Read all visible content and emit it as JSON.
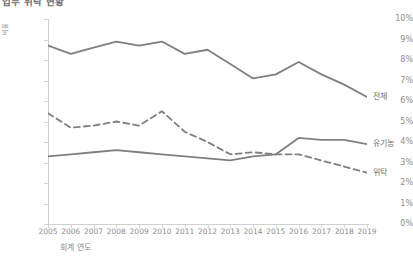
{
  "chart_title": "업무 위탁 현황",
  "axis": {
    "ylabel": "비율",
    "xlabel": "회계 연도",
    "ytick_labels": [
      "10%",
      "9%",
      "8%",
      "7%",
      "6%",
      "5%",
      "4%",
      "3%",
      "2%",
      "1%",
      "0%"
    ],
    "xtick_labels": [
      "2005",
      "2006",
      "2007",
      "2008",
      "2009",
      "2010",
      "2011",
      "2012",
      "2013",
      "2014",
      "2015",
      "2016",
      "2017",
      "2018",
      "2019"
    ]
  },
  "series_labels": {
    "total": "전체",
    "organic": "유기농",
    "contract": "위탁"
  },
  "colors": {
    "line": "#7f7f7f",
    "axis": "#d0d0d0",
    "text": "#8a8a8a"
  },
  "chart_data": {
    "type": "line",
    "title": "업무 위탁 현황",
    "xlabel": "회계 연도",
    "ylabel": "비율",
    "x": [
      2005,
      2006,
      2007,
      2008,
      2009,
      2010,
      2011,
      2012,
      2013,
      2014,
      2015,
      2016,
      2017,
      2018,
      2019
    ],
    "ylim": [
      0,
      10
    ],
    "ytick_values": [
      0,
      1,
      2,
      3,
      4,
      5,
      6,
      7,
      8,
      9,
      10
    ],
    "yunit": "percent",
    "grid": false,
    "legend": "right-inline-labels",
    "series": [
      {
        "name": "전체",
        "style": "solid",
        "color": "#7f7f7f",
        "values": [
          8.7,
          8.3,
          8.6,
          8.9,
          8.7,
          8.9,
          8.3,
          8.5,
          7.8,
          7.1,
          7.3,
          7.9,
          7.3,
          6.8,
          6.2
        ]
      },
      {
        "name": "유기농",
        "style": "solid",
        "color": "#7f7f7f",
        "values": [
          3.3,
          3.4,
          3.5,
          3.6,
          3.5,
          3.4,
          3.3,
          3.2,
          3.1,
          3.3,
          3.4,
          4.2,
          4.1,
          4.1,
          3.9
        ]
      },
      {
        "name": "위탁",
        "style": "dashed",
        "color": "#7f7f7f",
        "values": [
          5.4,
          4.7,
          4.8,
          5.0,
          4.8,
          5.5,
          4.5,
          4.0,
          3.4,
          3.5,
          3.4,
          3.4,
          3.1,
          2.8,
          2.5
        ]
      }
    ]
  }
}
